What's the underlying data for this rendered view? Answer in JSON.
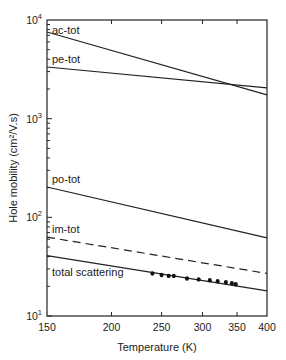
{
  "chart_data": {
    "type": "line",
    "title": "",
    "xlabel": "Temperature (K)",
    "ylabel": "Hole mobility (cm²/V.s)",
    "xscale": "log",
    "yscale": "log",
    "xlim": [
      150,
      400
    ],
    "ylim": [
      10,
      10000
    ],
    "grid": false,
    "legend": "inline labels",
    "x_ticks": [
      150,
      200,
      250,
      300,
      350,
      400
    ],
    "x_tick_labels": [
      "150",
      "200",
      "250",
      "300",
      "350",
      "400"
    ],
    "y_ticks": [
      10,
      100,
      1000,
      10000
    ],
    "y_tick_labels": [
      "10¹",
      "10²",
      "10³",
      "10⁴"
    ],
    "series": [
      {
        "name": "ac-tot",
        "style": "solid",
        "x": [
          150,
          400
        ],
        "y": [
          7550,
          1740
        ]
      },
      {
        "name": "pe-tot",
        "style": "solid",
        "x": [
          150,
          400
        ],
        "y": [
          3340,
          2050
        ]
      },
      {
        "name": "po-tot",
        "style": "solid",
        "x": [
          150,
          400
        ],
        "y": [
          203,
          62
        ]
      },
      {
        "name": "im-tot",
        "style": "dashed",
        "x": [
          150,
          400
        ],
        "y": [
          63,
          27
        ]
      },
      {
        "name": "total scattering",
        "style": "solid",
        "x": [
          150,
          400
        ],
        "y": [
          41,
          18
        ]
      }
    ],
    "measured_points": {
      "name": "experimental data",
      "marker": "filled circle",
      "x": [
        240,
        250,
        258,
        264,
        280,
        295,
        310,
        321,
        333,
        342,
        348
      ],
      "y": [
        27,
        26,
        25.5,
        25.5,
        24,
        23.5,
        23,
        22.5,
        22,
        21.5,
        21
      ]
    }
  }
}
